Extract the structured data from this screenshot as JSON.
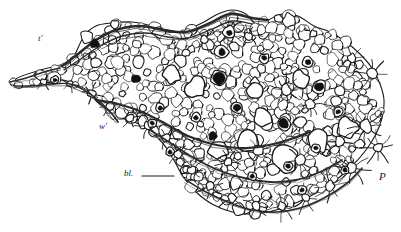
{
  "figure": {
    "domain": "scientific-illustration",
    "kind": "histological-line-drawing",
    "medium": "pen-and-ink engraving",
    "width": 401,
    "height": 232,
    "background_color": "#ffffff",
    "ink_color": "#1a1a1a",
    "cell_fill_color": "#ffffff",
    "nucleus_color": "#111111",
    "membrane_color": "#2b2b2b"
  },
  "labels": [
    {
      "id": "label-t-prime",
      "name": "label-t-prime",
      "text": "t'",
      "x": 38,
      "y": 34,
      "font_size": 9,
      "italic": true,
      "has_leader": false
    },
    {
      "id": "label-w-prime",
      "name": "label-w-prime",
      "text": "w'",
      "x": 99,
      "y": 122,
      "font_size": 9,
      "italic": true,
      "has_leader": false
    },
    {
      "id": "label-bl",
      "name": "label-bl",
      "text": "bl.",
      "x": 124,
      "y": 169,
      "font_size": 9,
      "italic": true,
      "has_leader": true,
      "leader": {
        "x1": 142,
        "y1": 176,
        "x2": 174,
        "y2": 176
      }
    },
    {
      "id": "label-p",
      "name": "label-p",
      "text": "P",
      "x": 379,
      "y": 171,
      "font_size": 11,
      "italic": true,
      "has_leader": false
    }
  ],
  "tissue_outline": [
    [
      62,
      66
    ],
    [
      72,
      60
    ],
    [
      84,
      36
    ],
    [
      96,
      26
    ],
    [
      112,
      23
    ],
    [
      132,
      22
    ],
    [
      152,
      26
    ],
    [
      168,
      32
    ],
    [
      186,
      30
    ],
    [
      204,
      22
    ],
    [
      218,
      14
    ],
    [
      232,
      10
    ],
    [
      246,
      14
    ],
    [
      256,
      24
    ],
    [
      268,
      20
    ],
    [
      282,
      14
    ],
    [
      298,
      16
    ],
    [
      314,
      26
    ],
    [
      330,
      32
    ],
    [
      346,
      42
    ],
    [
      360,
      54
    ],
    [
      372,
      68
    ],
    [
      380,
      84
    ],
    [
      384,
      100
    ],
    [
      382,
      118
    ],
    [
      376,
      134
    ],
    [
      366,
      150
    ],
    [
      352,
      166
    ],
    [
      336,
      180
    ],
    [
      318,
      192
    ],
    [
      298,
      202
    ],
    [
      276,
      210
    ],
    [
      254,
      214
    ],
    [
      232,
      212
    ],
    [
      212,
      204
    ],
    [
      196,
      192
    ],
    [
      184,
      178
    ],
    [
      176,
      164
    ],
    [
      168,
      150
    ],
    [
      158,
      138
    ],
    [
      146,
      128
    ],
    [
      134,
      122
    ],
    [
      122,
      118
    ],
    [
      110,
      112
    ],
    [
      100,
      104
    ],
    [
      92,
      96
    ],
    [
      84,
      90
    ],
    [
      74,
      84
    ],
    [
      64,
      78
    ]
  ],
  "tail_outline": [
    [
      62,
      66
    ],
    [
      48,
      68
    ],
    [
      34,
      72
    ],
    [
      22,
      76
    ],
    [
      14,
      80
    ],
    [
      10,
      84
    ],
    [
      16,
      86
    ],
    [
      28,
      86
    ],
    [
      40,
      84
    ],
    [
      52,
      82
    ],
    [
      62,
      80
    ],
    [
      70,
      82
    ],
    [
      80,
      86
    ],
    [
      90,
      92
    ],
    [
      98,
      98
    ]
  ],
  "membrane_strokes": [
    {
      "name": "upper-membrane",
      "points": [
        [
          62,
          66
        ],
        [
          78,
          54
        ],
        [
          96,
          40
        ],
        [
          116,
          30
        ],
        [
          140,
          26
        ],
        [
          164,
          30
        ],
        [
          186,
          32
        ],
        [
          208,
          24
        ],
        [
          230,
          14
        ],
        [
          252,
          18
        ],
        [
          268,
          20
        ]
      ],
      "weight": 2.6
    },
    {
      "name": "upper-membrane-inner",
      "points": [
        [
          64,
          70
        ],
        [
          82,
          58
        ],
        [
          100,
          46
        ],
        [
          122,
          36
        ],
        [
          146,
          33
        ],
        [
          168,
          37
        ],
        [
          188,
          38
        ],
        [
          210,
          30
        ],
        [
          232,
          21
        ],
        [
          252,
          24
        ]
      ],
      "weight": 1.3
    },
    {
      "name": "mid-septum",
      "points": [
        [
          96,
          100
        ],
        [
          118,
          104
        ],
        [
          142,
          112
        ],
        [
          166,
          124
        ],
        [
          188,
          136
        ],
        [
          212,
          144
        ],
        [
          238,
          148
        ],
        [
          264,
          146
        ],
        [
          288,
          140
        ],
        [
          310,
          132
        ]
      ],
      "weight": 2.2
    },
    {
      "name": "lower-septum",
      "points": [
        [
          150,
          130
        ],
        [
          172,
          144
        ],
        [
          194,
          158
        ],
        [
          218,
          170
        ],
        [
          244,
          178
        ],
        [
          270,
          182
        ],
        [
          296,
          180
        ],
        [
          320,
          172
        ],
        [
          342,
          160
        ]
      ],
      "weight": 1.8
    },
    {
      "name": "basal-membrane",
      "points": [
        [
          186,
          180
        ],
        [
          206,
          192
        ],
        [
          228,
          202
        ],
        [
          252,
          210
        ],
        [
          276,
          212
        ],
        [
          300,
          208
        ],
        [
          324,
          198
        ],
        [
          346,
          184
        ],
        [
          362,
          168
        ]
      ],
      "weight": 1.6
    },
    {
      "name": "left-taper-upper",
      "points": [
        [
          10,
          82
        ],
        [
          26,
          78
        ],
        [
          44,
          72
        ],
        [
          60,
          68
        ]
      ],
      "weight": 1.6
    },
    {
      "name": "left-taper-lower",
      "points": [
        [
          14,
          86
        ],
        [
          32,
          86
        ],
        [
          52,
          84
        ],
        [
          70,
          84
        ],
        [
          88,
          92
        ]
      ],
      "weight": 1.4
    },
    {
      "name": "left-notch",
      "points": [
        [
          88,
          92
        ],
        [
          102,
          104
        ],
        [
          112,
          114
        ],
        [
          118,
          122
        ]
      ],
      "weight": 1.8
    }
  ],
  "nuclei": [
    {
      "name": "nucleus",
      "x": 95,
      "y": 44,
      "r": 4.6,
      "halo": 0
    },
    {
      "name": "nucleus",
      "x": 136,
      "y": 79,
      "r": 4.2,
      "halo": 0
    },
    {
      "name": "nucleus",
      "x": 219,
      "y": 78,
      "r": 5.6,
      "halo": 2.5
    },
    {
      "name": "nucleus",
      "x": 222,
      "y": 52,
      "r": 3.4,
      "halo": 3.2
    },
    {
      "name": "nucleus",
      "x": 229,
      "y": 33,
      "r": 2.8,
      "halo": 0
    },
    {
      "name": "nucleus",
      "x": 237,
      "y": 108,
      "r": 3.6,
      "halo": 2.0
    },
    {
      "name": "nucleus",
      "x": 284,
      "y": 124,
      "r": 4.8,
      "halo": 2.2
    },
    {
      "name": "nucleus",
      "x": 213,
      "y": 136,
      "r": 4.4,
      "halo": 0
    },
    {
      "name": "nucleus",
      "x": 319,
      "y": 87,
      "r": 4.2,
      "halo": 2.6
    },
    {
      "name": "nucleus",
      "x": 308,
      "y": 62,
      "r": 2.6,
      "halo": 2.8
    },
    {
      "name": "nucleus",
      "x": 264,
      "y": 58,
      "r": 2.4,
      "halo": 2.6
    },
    {
      "name": "nucleus",
      "x": 160,
      "y": 108,
      "r": 2.2,
      "halo": 2.4
    },
    {
      "name": "nucleus",
      "x": 196,
      "y": 118,
      "r": 2.2,
      "halo": 2.4
    },
    {
      "name": "nucleus",
      "x": 338,
      "y": 112,
      "r": 2.2,
      "halo": 2.4
    },
    {
      "name": "nucleus",
      "x": 288,
      "y": 166,
      "r": 2.2,
      "halo": 2.4
    },
    {
      "name": "nucleus",
      "x": 316,
      "y": 148,
      "r": 2.2,
      "halo": 2.4
    },
    {
      "name": "nucleus",
      "x": 55,
      "y": 80,
      "r": 1.8,
      "halo": 2.2
    },
    {
      "name": "nucleus",
      "x": 152,
      "y": 123,
      "r": 2.0,
      "halo": 2.2
    },
    {
      "name": "nucleus",
      "x": 170,
      "y": 152,
      "r": 2.0,
      "halo": 2.2
    },
    {
      "name": "nucleus",
      "x": 252,
      "y": 176,
      "r": 2.0,
      "halo": 2.2
    },
    {
      "name": "nucleus",
      "x": 345,
      "y": 170,
      "r": 2.0,
      "halo": 2.2
    },
    {
      "name": "nucleus",
      "x": 302,
      "y": 190,
      "r": 2.0,
      "halo": 2.2
    }
  ],
  "stellate_cells": [
    {
      "name": "stellate-cell",
      "x": 229,
      "y": 31,
      "r": 6,
      "arms": 8,
      "arm_len": 9
    },
    {
      "name": "stellate-cell",
      "x": 372,
      "y": 74,
      "r": 5,
      "arms": 8,
      "arm_len": 11
    },
    {
      "name": "stellate-cell",
      "x": 366,
      "y": 126,
      "r": 6,
      "arms": 9,
      "arm_len": 13
    },
    {
      "name": "stellate-cell",
      "x": 378,
      "y": 148,
      "r": 5,
      "arms": 8,
      "arm_len": 12
    },
    {
      "name": "stellate-cell",
      "x": 352,
      "y": 168,
      "r": 5,
      "arms": 8,
      "arm_len": 12
    },
    {
      "name": "stellate-cell",
      "x": 330,
      "y": 186,
      "r": 5,
      "arms": 8,
      "arm_len": 12
    },
    {
      "name": "stellate-cell",
      "x": 306,
      "y": 198,
      "r": 4,
      "arms": 7,
      "arm_len": 11
    },
    {
      "name": "stellate-cell",
      "x": 282,
      "y": 206,
      "r": 4,
      "arms": 7,
      "arm_len": 10
    },
    {
      "name": "stellate-cell",
      "x": 256,
      "y": 206,
      "r": 4,
      "arms": 7,
      "arm_len": 10
    },
    {
      "name": "stellate-cell",
      "x": 232,
      "y": 198,
      "r": 4,
      "arms": 7,
      "arm_len": 10
    },
    {
      "name": "stellate-cell",
      "x": 210,
      "y": 186,
      "r": 4,
      "arms": 7,
      "arm_len": 10
    },
    {
      "name": "stellate-cell",
      "x": 192,
      "y": 170,
      "r": 4,
      "arms": 7,
      "arm_len": 9
    },
    {
      "name": "stellate-cell",
      "x": 178,
      "y": 154,
      "r": 4,
      "arms": 6,
      "arm_len": 8
    },
    {
      "name": "stellate-cell",
      "x": 166,
      "y": 138,
      "r": 4,
      "arms": 6,
      "arm_len": 8
    },
    {
      "name": "stellate-cell",
      "x": 148,
      "y": 126,
      "r": 4,
      "arms": 6,
      "arm_len": 8
    },
    {
      "name": "stellate-cell",
      "x": 130,
      "y": 118,
      "r": 4,
      "arms": 6,
      "arm_len": 8
    },
    {
      "name": "stellate-cell",
      "x": 110,
      "y": 106,
      "r": 4,
      "arms": 6,
      "arm_len": 8
    },
    {
      "name": "stellate-cell",
      "x": 92,
      "y": 94,
      "r": 4,
      "arms": 6,
      "arm_len": 8
    },
    {
      "name": "stellate-cell",
      "x": 286,
      "y": 90,
      "r": 5,
      "arms": 8,
      "arm_len": 10
    },
    {
      "name": "stellate-cell",
      "x": 310,
      "y": 104,
      "r": 5,
      "arms": 8,
      "arm_len": 10
    },
    {
      "name": "stellate-cell",
      "x": 258,
      "y": 150,
      "r": 5,
      "arms": 8,
      "arm_len": 10
    },
    {
      "name": "stellate-cell",
      "x": 228,
      "y": 162,
      "r": 4,
      "arms": 7,
      "arm_len": 9
    },
    {
      "name": "stellate-cell",
      "x": 300,
      "y": 160,
      "r": 5,
      "arms": 8,
      "arm_len": 10
    },
    {
      "name": "stellate-cell",
      "x": 340,
      "y": 142,
      "r": 5,
      "arms": 8,
      "arm_len": 10
    },
    {
      "name": "stellate-cell",
      "x": 204,
      "y": 40,
      "r": 4,
      "arms": 6,
      "arm_len": 8
    },
    {
      "name": "stellate-cell",
      "x": 248,
      "y": 36,
      "r": 4,
      "arms": 7,
      "arm_len": 9
    },
    {
      "name": "stellate-cell",
      "x": 352,
      "y": 58,
      "r": 4,
      "arms": 7,
      "arm_len": 9
    },
    {
      "name": "stellate-cell",
      "x": 70,
      "y": 84,
      "r": 3,
      "arms": 5,
      "arm_len": 7
    },
    {
      "name": "stellate-cell",
      "x": 44,
      "y": 82,
      "r": 3,
      "arms": 5,
      "arm_len": 7
    }
  ],
  "large_vacuoles": [
    {
      "name": "large-vacuole",
      "x": 248,
      "y": 142,
      "rx": 13,
      "ry": 11,
      "rot": -18
    },
    {
      "name": "large-vacuole",
      "x": 284,
      "y": 158,
      "rx": 15,
      "ry": 12,
      "rot": 12
    },
    {
      "name": "large-vacuole",
      "x": 318,
      "y": 140,
      "rx": 13,
      "ry": 10,
      "rot": -8
    },
    {
      "name": "large-vacuole",
      "x": 218,
      "y": 150,
      "rx": 10,
      "ry": 9,
      "rot": 22
    },
    {
      "name": "large-vacuole",
      "x": 348,
      "y": 128,
      "rx": 11,
      "ry": 9,
      "rot": 6
    },
    {
      "name": "large-vacuole",
      "x": 262,
      "y": 118,
      "rx": 10,
      "ry": 8,
      "rot": -14
    },
    {
      "name": "large-vacuole",
      "x": 196,
      "y": 88,
      "rx": 11,
      "ry": 9,
      "rot": 10
    },
    {
      "name": "large-vacuole",
      "x": 172,
      "y": 74,
      "rx": 9,
      "ry": 8,
      "rot": -6
    },
    {
      "name": "large-vacuole",
      "x": 300,
      "y": 80,
      "rx": 9,
      "ry": 8,
      "rot": 16
    },
    {
      "name": "large-vacuole",
      "x": 254,
      "y": 92,
      "rx": 9,
      "ry": 7,
      "rot": -20
    }
  ],
  "cell_field": {
    "name": "cell-field",
    "description": "densely packed rounded cells filling the tissue outline",
    "seed": 20240517,
    "cell_count": 520,
    "min_radius": 3.0,
    "max_radius": 6.4,
    "stroke_weight": 0.85,
    "jitter": 0.35
  }
}
